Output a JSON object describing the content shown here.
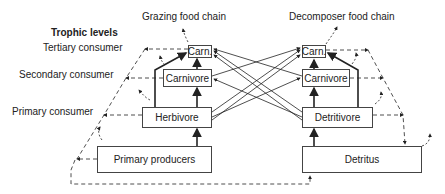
{
  "titles": {
    "grazing": "Grazing food chain",
    "decomposer": "Decomposer food chain"
  },
  "trophic_levels": {
    "heading": "Trophic levels",
    "tertiary": "Tertiary consumer",
    "secondary": "Secondary consumer",
    "primary": "Primary consumer"
  },
  "grazing_chain": {
    "tertiary": "Carn.",
    "secondary": "Carnivore",
    "primary": "Herbivore",
    "producers": "Primary producers"
  },
  "decomposer_chain": {
    "tertiary": "Carn.",
    "secondary": "Carnivore",
    "primary": "Detritivore",
    "base": "Detritus"
  },
  "colors": {
    "line": "#222222",
    "box_border": "#444444",
    "background": "#ffffff"
  }
}
